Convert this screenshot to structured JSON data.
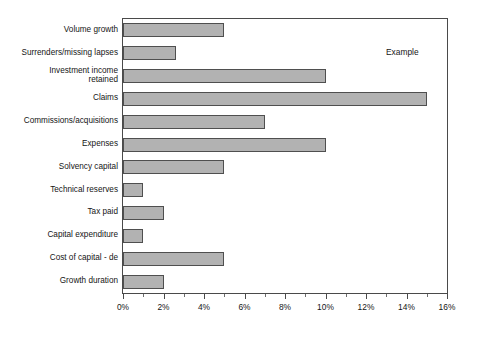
{
  "chart_data": {
    "type": "bar",
    "orientation": "horizontal",
    "title": "",
    "xlabel": "",
    "ylabel": "",
    "xlim": [
      0,
      16
    ],
    "xunit": "%",
    "grid": false,
    "legend": false,
    "annotation": "Example",
    "categories": [
      "Volume growth",
      "Surrenders/missing lapses",
      "Investment income\nretained",
      "Claims",
      "Commissions/acquisitions",
      "Expenses",
      "Solvency capital",
      "Technical reserves",
      "Tax paid",
      "Capital expenditure",
      "Cost of capital - de",
      "Growth duration"
    ],
    "values": [
      5,
      2.6,
      10,
      15,
      7,
      10,
      5,
      1,
      2,
      1,
      5,
      2
    ],
    "tick_labels": [
      "0%",
      "2%",
      "4%",
      "6%",
      "8%",
      "10%",
      "12%",
      "14%",
      "16%"
    ],
    "tick_values": [
      0,
      2,
      4,
      6,
      8,
      10,
      12,
      14,
      16
    ],
    "minor_tick_values": [
      1,
      3,
      5,
      7,
      9,
      11,
      13,
      15
    ],
    "bar_fill_color": "#b2b2b2",
    "bar_border_color": "#4f4f4f",
    "frame_color": "#4a4a4a"
  },
  "title_strip": ""
}
